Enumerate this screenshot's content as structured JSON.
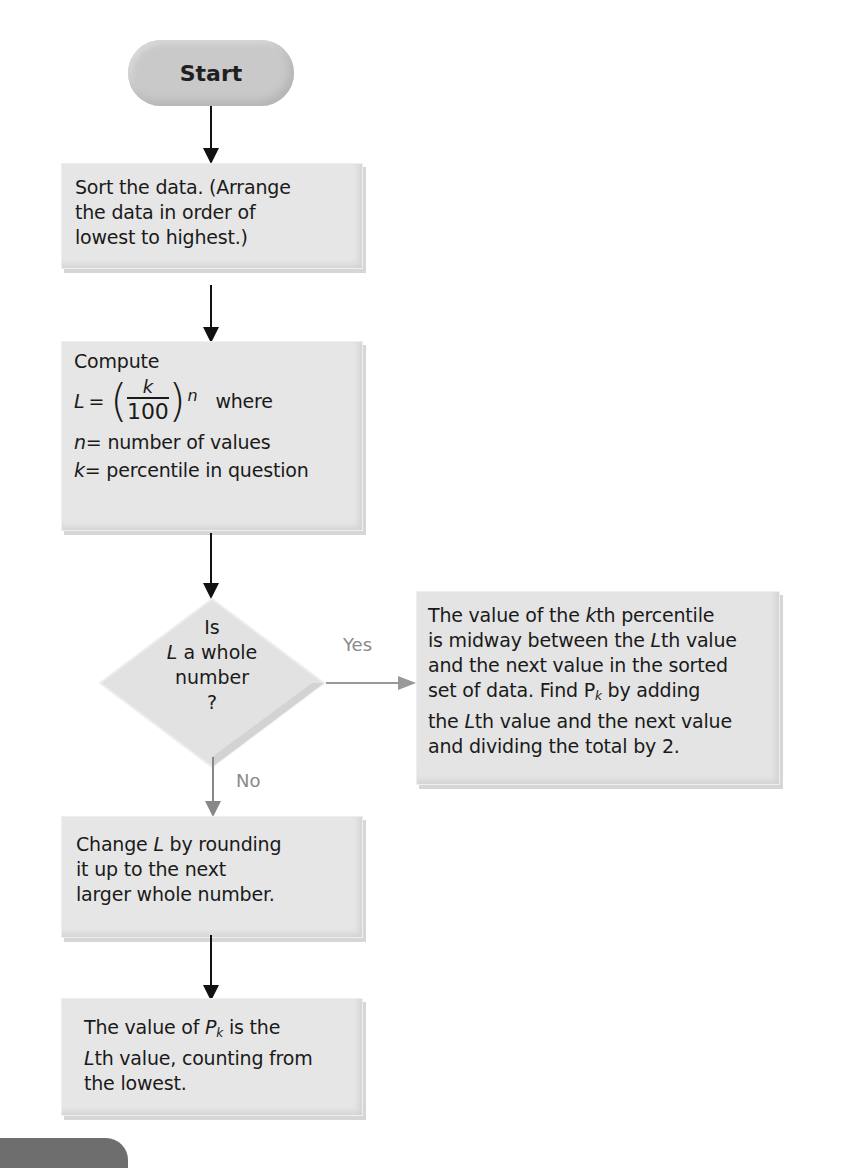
{
  "start": {
    "label": "Start"
  },
  "sort_box": {
    "lines": [
      "Sort the data. (Arrange",
      "the data in order of",
      "lowest to highest.)"
    ]
  },
  "compute_box": {
    "title": "Compute",
    "formula": {
      "lhs": "L",
      "eq": "=",
      "numerator": "k",
      "denominator": "100",
      "factor": "n",
      "where": "where"
    },
    "defs": [
      {
        "sym": "n",
        "text": "= number of values"
      },
      {
        "sym": "k",
        "text": "= percentile in question"
      }
    ]
  },
  "decision": {
    "lines": [
      "Is",
      "L a whole",
      "number",
      "?"
    ],
    "yes_label": "Yes",
    "no_label": "No"
  },
  "yes_box": {
    "l1a": "The value of the ",
    "l1k": "k",
    "l1b": "th percentile",
    "l2a": "is midway between the ",
    "l2L": "L",
    "l2b": "th value",
    "l3": "and the next value in the sorted",
    "l4a": "set of data. Find P",
    "l4sub": "k",
    "l4b": " by adding",
    "l5a": "the ",
    "l5L": "L",
    "l5b": "th value and the next value",
    "l6": "and dividing the total by 2."
  },
  "round_box": {
    "l1a": "Change ",
    "l1L": "L",
    "l1b": " by rounding",
    "l2": "it up to the next",
    "l3": "larger whole number."
  },
  "final_box": {
    "l1a": "The value of ",
    "l1P": "P",
    "l1sub": "k",
    "l1b": " is the",
    "l2L": "L",
    "l2b": "th value, counting from",
    "l3": "the lowest."
  },
  "colors": {
    "box_fill": "#e6e6e6",
    "terminal_fill": "#c9c9c9",
    "arrow_dark": "#111111",
    "arrow_gray": "#999999",
    "label_gray": "#8a8a8a",
    "tab_fill": "#6e6e6e"
  }
}
